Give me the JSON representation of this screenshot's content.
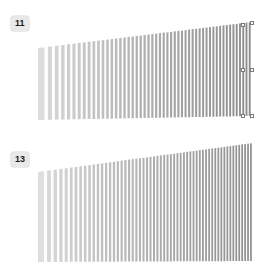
{
  "canvas": {
    "background": "#ffffff",
    "width": 269,
    "height": 276
  },
  "shapes": [
    {
      "id": "shape-11",
      "label": "11",
      "selected": true,
      "stripe_count": 52,
      "stripe_fill_light": "#dcdcdc",
      "stripe_fill_dark": "#8a8a8a",
      "gap_fill": "#ffffff",
      "geometry": {
        "left_x": 38,
        "right_x": 252,
        "top_left_y": 48,
        "top_right_y": 22,
        "bottom_left_y": 120,
        "bottom_right_y": 116
      },
      "handles": [
        {
          "name": "handle-top-right",
          "x": 250,
          "y": 21
        },
        {
          "name": "handle-middle-right",
          "x": 250,
          "y": 68
        },
        {
          "name": "handle-bottom-right",
          "x": 250,
          "y": 114
        },
        {
          "name": "handle-middle-left-inner",
          "x": 241,
          "y": 68
        },
        {
          "name": "handle-top-inner",
          "x": 241,
          "y": 23
        },
        {
          "name": "handle-bottom-inner",
          "x": 241,
          "y": 114
        }
      ]
    },
    {
      "id": "shape-13",
      "label": "13",
      "selected": false,
      "stripe_count": 58,
      "stripe_fill_light": "#dedede",
      "stripe_fill_dark": "#8c8c8c",
      "gap_fill": "#ffffff",
      "geometry": {
        "left_x": 38,
        "right_x": 253,
        "top_left_y": 172,
        "top_right_y": 143,
        "bottom_left_y": 262,
        "bottom_right_y": 261
      },
      "handles": []
    }
  ],
  "chart_data": {
    "type": "bar",
    "title": "",
    "xlabel": "",
    "ylabel": "",
    "note": "Two perspective-projected striped rectangular panels rendered as vertical bar fields with a left-to-right darkening gradient.",
    "panels": [
      {
        "label": "11",
        "categories_count": 52,
        "value_min": 0,
        "value_max": 1,
        "gradient_from": "#dcdcdc",
        "gradient_to": "#8a8a8a"
      },
      {
        "label": "13",
        "categories_count": 58,
        "value_min": 0,
        "value_max": 1,
        "gradient_from": "#dedede",
        "gradient_to": "#8c8c8c"
      }
    ]
  }
}
